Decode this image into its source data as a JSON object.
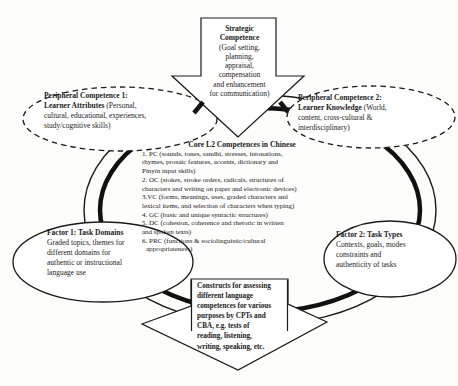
{
  "colors": {
    "ink": "#1a1a1a",
    "background": "#fdfdfc"
  },
  "strategic": {
    "title_line1": "Strategic",
    "title_line2": "Competence",
    "body_lines": [
      "(Goal setting,",
      "planning,",
      "appraisal,",
      "compensation",
      "and enhancement",
      "for communication)"
    ]
  },
  "peripheral1": {
    "title": "Peripheral Competence 1:",
    "bold_lead": "Learner Attributes",
    "lead_rest": " (Personal,",
    "lines": [
      "cultural, educational, experiences,",
      "study/cognitive skills)"
    ]
  },
  "peripheral2": {
    "title": "Peripheral Competence 2:",
    "bold_lead": "Learner Knowledge",
    "lead_rest": " (World,",
    "lines": [
      "content, cross-cultural &",
      "interdisciplinary)"
    ]
  },
  "core": {
    "title": "Core L2 Competences in Chinese",
    "lines": [
      "1. PC (sounds, tones, sandhi, stresses, intonations,",
      "rhymes, prosaic features, accents, dictionary and",
      "Pinyin input skills)",
      "2. OC (stokes, stroke orders, radicals, structures of",
      "characters and writing on paper and electronic devices)",
      "3.VC (forms, meanings, uses, graded characters and",
      "lexical items, and selection of characters when typing)",
      "4. GC (basic and unique syntactic structures)",
      "5. DC (cohesion, coherence and rhetoric in written",
      "and spoken texts)",
      "6. PRC (functions & sociolinguistic/cultural",
      "appropriateness)"
    ]
  },
  "factor1": {
    "title": "Factor 1: Task Domains",
    "lines": [
      "Graded topics, themes for",
      "different domains for",
      "authentic or instructional",
      "language use"
    ]
  },
  "factor2": {
    "title": "Factor 2: Task Types",
    "lines": [
      "Contexts, goals, modes",
      "constraints and",
      "authenticity of tasks"
    ]
  },
  "constructs": {
    "lines": [
      "Constructs for assessing",
      "different language",
      "competences for various",
      "purposes by CPTs and",
      "CBA, e.g. tests of",
      "reading, listening,",
      "writing, speaking, etc."
    ]
  }
}
